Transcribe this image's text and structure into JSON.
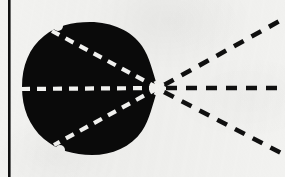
{
  "figure": {
    "caption": "",
    "background_color": "#f2f2f0",
    "ink_color": "#0a0a0a",
    "highlight_color": "#f4f4f2",
    "canvas": {
      "width": 285,
      "height": 177
    }
  },
  "border": {
    "left_rule": {
      "label": "vertical-rule",
      "x": 8,
      "width": 2.6,
      "y_start": 0,
      "y_end": 177,
      "color": "#101010"
    }
  },
  "blob": {
    "label": "solid-black-region",
    "fill_color": "#0a0a0a",
    "apex": {
      "x": 158,
      "y": 88
    },
    "bounds": {
      "left": 22,
      "right": 158,
      "top": 22,
      "bottom": 155
    },
    "outline_path": "M 158 88 C 152 70 150 58 142 46 C 132 31 112 22 90 22 C 72 22 56 26 44 36 C 29 48 22 66 22 87 C 22 108 29 126 44 139 C 57 150 74 155 92 155 C 112 155 131 147 142 131 C 150 119 152 106 158 88 Z",
    "notches": [
      {
        "label": "top-notch",
        "x": 58,
        "y": 26
      },
      {
        "label": "bottom-notch",
        "x": 60,
        "y": 150
      }
    ]
  },
  "rays": {
    "origin": {
      "x": 158,
      "y": 88
    },
    "dash_pattern_inner": "9 7",
    "dash_pattern_outer": "11 9",
    "inner_width": 4.2,
    "outer_width": 4.6,
    "items": [
      {
        "id": "ray-upper-left",
        "label": "upper-left-ray",
        "segment": "inner",
        "color": "#f4f4f2",
        "from": {
          "x": 158,
          "y": 88
        },
        "to": {
          "x": 52,
          "y": 31
        },
        "angle_deg": 208
      },
      {
        "id": "ray-horizontal-inner",
        "label": "horizontal-inner-ray",
        "segment": "inner",
        "color": "#f4f4f2",
        "from": {
          "x": 158,
          "y": 88
        },
        "to": {
          "x": 20,
          "y": 89
        },
        "angle_deg": 180
      },
      {
        "id": "ray-lower-left",
        "label": "lower-left-ray",
        "segment": "inner",
        "color": "#f4f4f2",
        "from": {
          "x": 158,
          "y": 88
        },
        "to": {
          "x": 54,
          "y": 145
        },
        "angle_deg": 152
      },
      {
        "id": "ray-upper-right",
        "label": "upper-right-ray",
        "segment": "outer",
        "color": "#101010",
        "from": {
          "x": 164,
          "y": 85
        },
        "to": {
          "x": 285,
          "y": 18
        },
        "angle_deg": 331
      },
      {
        "id": "ray-horizontal-outer",
        "label": "horizontal-outer-ray",
        "segment": "outer",
        "color": "#101010",
        "from": {
          "x": 166,
          "y": 88
        },
        "to": {
          "x": 285,
          "y": 88
        },
        "angle_deg": 0
      },
      {
        "id": "ray-lower-right",
        "label": "lower-right-ray",
        "segment": "outer",
        "color": "#101010",
        "from": {
          "x": 164,
          "y": 92
        },
        "to": {
          "x": 285,
          "y": 155
        },
        "angle_deg": 27
      }
    ]
  }
}
